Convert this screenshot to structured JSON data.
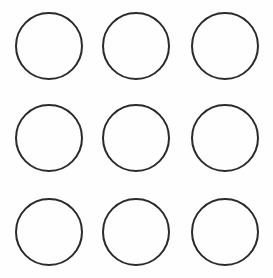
{
  "canvas": {
    "width": 273,
    "height": 278,
    "background_color": "#fefefe",
    "title": "Circle Grid"
  },
  "style": {
    "stroke_color": "#2b2b2b",
    "stroke_width": 2,
    "fill_color": "none"
  },
  "grid": {
    "rows": 3,
    "columns": 3,
    "count": 9,
    "shape": "circle",
    "column_left_edges": [
      16,
      103,
      192
    ],
    "row_top_edges": [
      13,
      105,
      199
    ],
    "diameter": 66
  },
  "chart_data": {
    "type": "scatter",
    "xlabel": "",
    "ylabel": "",
    "xlim": [
      0,
      273
    ],
    "ylim": [
      0,
      278
    ],
    "grid": false,
    "legend": "none",
    "series": [
      {
        "name": "circles",
        "marker": "open-circle",
        "radius": 33,
        "points": [
          {
            "label": "r1c1",
            "cx": 49,
            "cy": 46
          },
          {
            "label": "r1c2",
            "cx": 136,
            "cy": 46
          },
          {
            "label": "r1c3",
            "cx": 225,
            "cy": 46
          },
          {
            "label": "r2c1",
            "cx": 49,
            "cy": 138
          },
          {
            "label": "r2c2",
            "cx": 136,
            "cy": 138
          },
          {
            "label": "r2c3",
            "cx": 225,
            "cy": 138
          },
          {
            "label": "r3c1",
            "cx": 49,
            "cy": 232
          },
          {
            "label": "r3c2",
            "cx": 136,
            "cy": 232
          },
          {
            "label": "r3c3",
            "cx": 225,
            "cy": 232
          }
        ]
      }
    ]
  },
  "circles": [
    {
      "id": "circle-r1c1",
      "row": 1,
      "col": 1,
      "cx": 49,
      "cy": 46,
      "r": 33
    },
    {
      "id": "circle-r1c2",
      "row": 1,
      "col": 2,
      "cx": 136,
      "cy": 46,
      "r": 33
    },
    {
      "id": "circle-r1c3",
      "row": 1,
      "col": 3,
      "cx": 225,
      "cy": 46,
      "r": 33
    },
    {
      "id": "circle-r2c1",
      "row": 2,
      "col": 1,
      "cx": 49,
      "cy": 138,
      "r": 33
    },
    {
      "id": "circle-r2c2",
      "row": 2,
      "col": 2,
      "cx": 136,
      "cy": 138,
      "r": 33
    },
    {
      "id": "circle-r2c3",
      "row": 2,
      "col": 3,
      "cx": 225,
      "cy": 138,
      "r": 33
    },
    {
      "id": "circle-r3c1",
      "row": 3,
      "col": 1,
      "cx": 49,
      "cy": 232,
      "r": 33
    },
    {
      "id": "circle-r3c2",
      "row": 3,
      "col": 2,
      "cx": 136,
      "cy": 232,
      "r": 33
    },
    {
      "id": "circle-r3c3",
      "row": 3,
      "col": 3,
      "cx": 225,
      "cy": 232,
      "r": 33
    }
  ]
}
